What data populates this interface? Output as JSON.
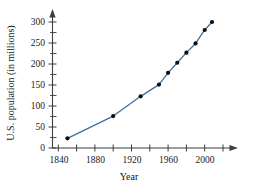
{
  "chart_data": {
    "type": "line",
    "title": "",
    "xlabel": "Year",
    "ylabel": "U.S. population (in millions)",
    "xlim": [
      1830,
      2020
    ],
    "ylim": [
      0,
      312
    ],
    "grid": false,
    "legend": "none",
    "line_color": "#3f6f9f",
    "marker_color": "#0d0d0d",
    "axis_color": "#3d3d3d",
    "x_ticks": [
      1840,
      1860,
      1880,
      1900,
      1920,
      1940,
      1960,
      1980,
      2000,
      2020
    ],
    "x_tick_labels": [
      "1840",
      "",
      "1880",
      "",
      "1920",
      "",
      "1960",
      "",
      "2000",
      ""
    ],
    "x_major_labels": [
      "1840",
      "1880",
      "1920",
      "1960",
      "2000"
    ],
    "y_ticks": [
      0,
      25,
      50,
      75,
      100,
      125,
      150,
      175,
      200,
      225,
      250,
      275,
      300
    ],
    "y_tick_labels": [
      "0",
      "",
      "50",
      "",
      "100",
      "",
      "150",
      "",
      "200",
      "",
      "250",
      "",
      "300"
    ],
    "y_major_labels": [
      "0",
      "50",
      "100",
      "150",
      "200",
      "250",
      "300"
    ],
    "x": [
      1850,
      1900,
      1930,
      1950,
      1960,
      1970,
      1980,
      1990,
      2000,
      2008
    ],
    "values": [
      23,
      76,
      123,
      151,
      179,
      203,
      227,
      249,
      281,
      300
    ],
    "points": [
      {
        "year": 1850,
        "population": 23
      },
      {
        "year": 1900,
        "population": 76
      },
      {
        "year": 1930,
        "population": 123
      },
      {
        "year": 1950,
        "population": 151
      },
      {
        "year": 1960,
        "population": 179
      },
      {
        "year": 1970,
        "population": 203
      },
      {
        "year": 1980,
        "population": 227
      },
      {
        "year": 1990,
        "population": 249
      },
      {
        "year": 2000,
        "population": 281
      },
      {
        "year": 2008,
        "population": 300
      }
    ]
  }
}
